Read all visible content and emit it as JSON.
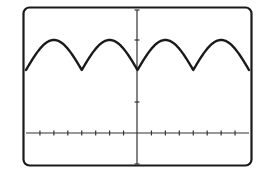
{
  "display": {
    "type": "oscilloscope-screen",
    "description": "Full-wave rectified sine waveform with DC offset",
    "colors": {
      "background": "#ffffff",
      "trace": "#1a1a1a",
      "frame": "#1a1a1a",
      "graticule": "#333333"
    }
  },
  "chart_data": {
    "type": "line",
    "title": "",
    "xlabel": "",
    "ylabel": "",
    "grid": false,
    "waveform": "full-wave rectified sine (|sin|)",
    "cycles_visible": 4,
    "x_divisions": 16,
    "y_divisions": 5,
    "series": [
      {
        "name": "trace",
        "x": [
          0,
          0.5,
          1,
          1.5,
          2,
          2.5,
          3,
          3.5,
          4
        ],
        "values": [
          0.5,
          1.0,
          0.5,
          1.0,
          0.5,
          1.0,
          0.5,
          1.0,
          0.5
        ]
      }
    ]
  }
}
